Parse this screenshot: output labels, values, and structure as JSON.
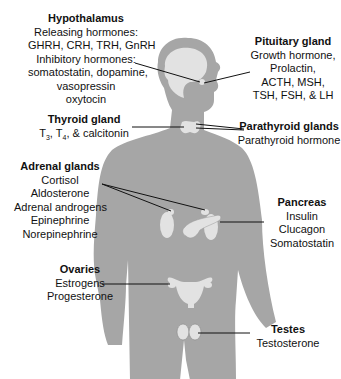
{
  "colors": {
    "body": "#a6a6a6",
    "organ": "#e2e2e2",
    "line": "#111111",
    "text": "#111111"
  },
  "labels": {
    "hypothalamus": {
      "title": "Hypothalamus",
      "lines": [
        "Releasing hormones:",
        "GHRH, CRH, TRH, GnRH",
        "Inhibitory hormones:",
        "somatostatin, dopamine,",
        "vasopressin",
        "oxytocin"
      ]
    },
    "pituitary": {
      "title": "Pituitary gland",
      "lines": [
        "Growth hormone,",
        "Prolactin,",
        "ACTH, MSH,",
        "TSH, FSH, & LH"
      ]
    },
    "thyroid": {
      "title": "Thyroid gland",
      "lines": [
        "T3, T4, & calcitonin"
      ],
      "sub3": "3",
      "sub4": "4",
      "t": "T",
      "rest": ", & calcitonin",
      "comma": ", "
    },
    "parathyroid": {
      "title": "Parathyroid glands",
      "lines": [
        "Parathyroid hormone"
      ]
    },
    "adrenal": {
      "title": "Adrenal glands",
      "lines": [
        "Cortisol",
        "Aldosterone",
        "Adrenal androgens",
        "Epinephrine",
        "Norepinephrine"
      ]
    },
    "pancreas": {
      "title": "Pancreas",
      "lines": [
        "Insulin",
        "Clucagon",
        "Somatostatin"
      ]
    },
    "ovaries": {
      "title": "Ovaries",
      "lines": [
        "Estrogens",
        "Progesterone"
      ]
    },
    "testes": {
      "title": "Testes",
      "lines": [
        "Testosterone"
      ]
    }
  }
}
